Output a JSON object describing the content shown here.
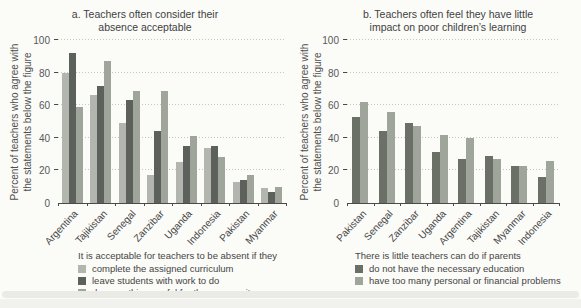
{
  "figure": {
    "footnote_clipped": "Note: Percentages are based on the share of teachers who agreed with each statement in surveys of teachers conducted in the countries shown in the figure above."
  },
  "palette": {
    "light_bar": "#b2b6ae",
    "dark_bar": "#5c625b",
    "medium_bar": "#a0a59b",
    "dark_bar_b": "#6b7067",
    "grid": "#c8c8c1",
    "axis": "#4a4a4a",
    "background": "#fbfbf8"
  },
  "chart_data": [
    {
      "type": "bar",
      "title_lines": [
        "a. Teachers often consider their",
        "absence acceptable"
      ],
      "ylabel_lines": [
        "Percent of teachers who agree with",
        "the statements below the figure"
      ],
      "ylim": [
        0,
        100
      ],
      "yticks": [
        0,
        20,
        40,
        60,
        80,
        100
      ],
      "grid": "horizontal-dotted",
      "legend_position": "below",
      "legend_title": "It is acceptable for teachers to be absent if they",
      "categories": [
        "Argentina",
        "Tajikistan",
        "Senegal",
        "Zanzibar",
        "Uganda",
        "Indonesia",
        "Pakistan",
        "Myanmar"
      ],
      "series": [
        {
          "name": "complete the assigned curriculum",
          "color": "#b2b6ae",
          "values": [
            80,
            66,
            49,
            17,
            25,
            34,
            13,
            9
          ]
        },
        {
          "name": "leave students with work to do",
          "color": "#5c625b",
          "values": [
            92,
            72,
            63,
            44,
            35,
            35,
            14,
            7
          ]
        },
        {
          "name": "do something useful for the community",
          "color": "#a0a59b",
          "values": [
            59,
            87,
            69,
            69,
            41,
            28,
            17,
            10
          ]
        }
      ]
    },
    {
      "type": "bar",
      "title_lines": [
        "b. Teachers often feel they have little",
        "impact on poor children’s learning"
      ],
      "ylabel_lines": [
        "Percent of teachers who agree with",
        "the statements below the figure"
      ],
      "ylim": [
        0,
        100
      ],
      "yticks": [
        0,
        20,
        40,
        60,
        80,
        100
      ],
      "grid": "horizontal-dotted",
      "legend_position": "below",
      "legend_title": "There is little teachers can do if parents",
      "categories": [
        "Pakistan",
        "Senegal",
        "Zanzibar",
        "Uganda",
        "Argentina",
        "Tajikistan",
        "Myanmar",
        "Indonesia"
      ],
      "series": [
        {
          "name": "do not have the necessary education",
          "color": "#6b7067",
          "values": [
            53,
            44,
            49,
            31,
            27,
            29,
            23,
            16
          ]
        },
        {
          "name": "have too many personal or financial problems",
          "color": "#a0a59b",
          "values": [
            62,
            56,
            47,
            42,
            40,
            27,
            23,
            26
          ]
        }
      ]
    }
  ]
}
